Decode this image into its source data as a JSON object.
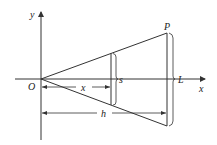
{
  "diagram": {
    "type": "geometry-figure",
    "colors": {
      "line": "#333333",
      "background": "#ffffff"
    },
    "labels": {
      "y_axis": "y",
      "x_axis": "x",
      "origin": "O",
      "point_p": "P",
      "slice_length": "s",
      "end_length": "L",
      "slice_distance": "x",
      "total_distance": "h"
    }
  }
}
